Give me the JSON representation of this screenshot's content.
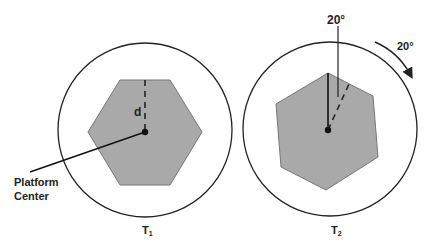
{
  "diagram": {
    "panels": [
      {
        "id": "T1",
        "label_main": "T",
        "label_sub": "1",
        "distance_label": "d",
        "callout": [
          "Platform",
          "Center"
        ]
      },
      {
        "id": "T2",
        "label_main": "T",
        "label_sub": "2",
        "angle_label": "20°",
        "rotation_label": "20°",
        "rotation_direction": "clockwise"
      }
    ],
    "colors": {
      "hexagon_fill": "#a9a9a9",
      "stroke": "#222222",
      "background": "#ffffff"
    }
  }
}
